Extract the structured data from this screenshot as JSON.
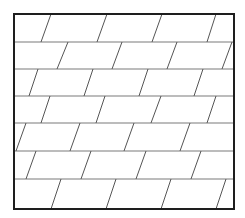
{
  "diagram": {
    "type": "parallelogram-tiling",
    "canvas": {
      "width": 245,
      "height": 218,
      "background": "#ffffff"
    },
    "frame": {
      "x": 14,
      "y": 14,
      "width": 220,
      "height": 195,
      "stroke": "#1e1e1e",
      "stroke_width": 2
    },
    "rows": 7,
    "row_boundaries_y": [
      14,
      42,
      69,
      96,
      123,
      151,
      179,
      209
    ],
    "colors": {
      "frame": "#1e1e1e",
      "row_line": "#7a7a7a",
      "slant_line": "#555555"
    },
    "slants": [
      {
        "row": 1,
        "segments": [
          [
            51,
            41
          ],
          [
            107,
            97
          ],
          [
            162,
            152
          ],
          [
            216,
            207
          ]
        ]
      },
      {
        "row": 2,
        "segments": [
          [
            68,
            57
          ],
          [
            122,
            112
          ],
          [
            177,
            167
          ],
          [
            232,
            222
          ]
        ]
      },
      {
        "row": 3,
        "segments": [
          [
            38,
            29
          ],
          [
            93,
            84
          ],
          [
            148,
            139
          ],
          [
            203,
            194
          ]
        ]
      },
      {
        "row": 4,
        "segments": [
          [
            50,
            41
          ],
          [
            105,
            96
          ],
          [
            161,
            151
          ],
          [
            216,
            207
          ]
        ]
      },
      {
        "row": 5,
        "segments": [
          [
            26,
            16
          ],
          [
            80,
            70
          ],
          [
            134,
            124
          ],
          [
            190,
            180
          ]
        ]
      },
      {
        "row": 6,
        "segments": [
          [
            36,
            26
          ],
          [
            91,
            81
          ],
          [
            146,
            136
          ],
          [
            201,
            191
          ]
        ]
      },
      {
        "row": 7,
        "segments": [
          [
            61,
            51
          ],
          [
            116,
            106
          ],
          [
            171,
            161
          ],
          [
            226,
            216
          ]
        ]
      }
    ]
  }
}
